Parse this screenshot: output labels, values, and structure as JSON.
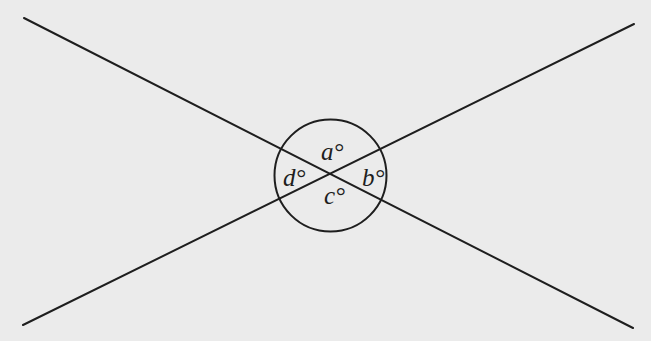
{
  "figure": {
    "background_color": "#ebebeb",
    "stroke_color": "#1e1e1e",
    "lines": [
      {
        "name": "line-1",
        "x1": 24,
        "y1": 18,
        "x2": 633,
        "y2": 328
      },
      {
        "name": "line-2",
        "x1": 23,
        "y1": 325,
        "x2": 634,
        "y2": 24
      }
    ],
    "intersection": {
      "x": 331,
      "y": 174
    },
    "circle": {
      "cx": 330.5,
      "cy": 175.5,
      "r": 56
    },
    "angle_labels": {
      "a": {
        "text": "a°",
        "position": "top"
      },
      "b": {
        "text": "b°",
        "position": "right"
      },
      "c": {
        "text": "c°",
        "position": "bottom"
      },
      "d": {
        "text": "d°",
        "position": "left"
      }
    }
  }
}
